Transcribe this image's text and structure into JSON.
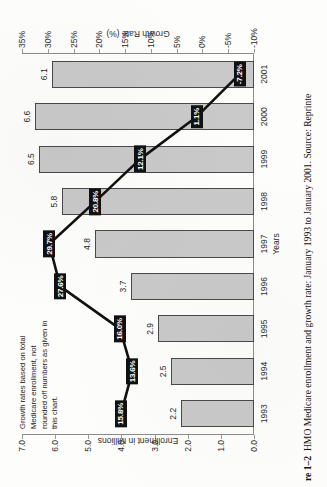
{
  "caption": {
    "number": "re 1–2",
    "text": "HMO Medicare enrollment and growth rate: January 1993 to January 2001. Source: Reprinte"
  },
  "note": "Growth rates based on total Medicare enrollment, not rounded off numbers as given in this chart.",
  "axes": {
    "left_title": "Enrollment in Millions",
    "right_title": "Growth Rate (%)",
    "bottom_title": "Years",
    "left_ticks": [
      "7.0",
      "6.0",
      "5.0",
      "4.0",
      "3.0",
      "2.0",
      "1.0",
      "0.0"
    ],
    "right_ticks": [
      "35%",
      "30%",
      "25%",
      "20%",
      "15%",
      "10%",
      "5%",
      "0%",
      "-5%",
      "-10%"
    ]
  },
  "chart_data": {
    "type": "bar",
    "title": "HMO Medicare enrollment and growth rate: January 1993 to January 2001",
    "xlabel": "Years",
    "ylabel": "Enrollment in Millions",
    "y2label": "Growth Rate (%)",
    "categories": [
      "1993",
      "1994",
      "1995",
      "1996",
      "1997",
      "1998",
      "1999",
      "2000",
      "2001"
    ],
    "ylim": [
      0.0,
      7.0
    ],
    "y2lim": [
      -10,
      35
    ],
    "grid": false,
    "legend": "none",
    "series": [
      {
        "name": "Enrollment in Millions",
        "type": "bar",
        "axis": "left",
        "values": [
          2.2,
          2.5,
          2.9,
          3.7,
          4.8,
          5.8,
          6.5,
          6.6,
          6.1
        ],
        "labels": [
          "2.2",
          "2.5",
          "2.9",
          "3.7",
          "4.8",
          "5.8",
          "6.5",
          "6.6",
          "6.1"
        ]
      },
      {
        "name": "Growth Rate (%)",
        "type": "line",
        "axis": "right",
        "values": [
          15.8,
          13.6,
          16.0,
          27.6,
          29.7,
          20.8,
          12.1,
          1.1,
          -7.2
        ],
        "labels": [
          "15.8%",
          "13.6%",
          "16.0%",
          "27.6%",
          "29.7%",
          "20.8%",
          "12.1%",
          "1.1%",
          "-7.2%"
        ]
      }
    ]
  }
}
